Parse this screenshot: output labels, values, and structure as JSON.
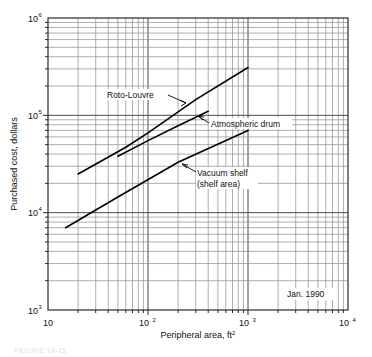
{
  "figure": {
    "caption": "FIGURE 14-11",
    "date_stamp": "Jan. 1990"
  },
  "chart_data": {
    "type": "line",
    "scale": "log-log",
    "title": "",
    "xlabel": "Peripheral area, ft",
    "xlabel_exponent": "2",
    "ylabel": "Purchased cost, dollars",
    "xlim": [
      10,
      10000
    ],
    "ylim": [
      1000,
      1000000
    ],
    "grid": "both-minor-and-major",
    "legend_position": "inline-annotations",
    "x_ticks": [
      {
        "value": 10,
        "label": "10",
        "exponent": ""
      },
      {
        "value": 100,
        "label": "10",
        "exponent": "2"
      },
      {
        "value": 1000,
        "label": "10",
        "exponent": "3"
      },
      {
        "value": 10000,
        "label": "10",
        "exponent": "4"
      }
    ],
    "y_ticks": [
      {
        "value": 1000,
        "label": "10",
        "exponent": "3"
      },
      {
        "value": 10000,
        "label": "10",
        "exponent": "4"
      },
      {
        "value": 100000,
        "label": "10",
        "exponent": "5"
      },
      {
        "value": 1000000,
        "label": "10",
        "exponent": "6"
      }
    ],
    "series": [
      {
        "name": "Roto-Louvre",
        "label": "Roto-Louvre",
        "points": [
          {
            "x": 20,
            "y": 25000
          },
          {
            "x": 60,
            "y": 47000
          },
          {
            "x": 100,
            "y": 66000
          },
          {
            "x": 300,
            "y": 145000
          },
          {
            "x": 1000,
            "y": 310000
          }
        ]
      },
      {
        "name": "Atmospheric drum",
        "label": "Atmospheric drum",
        "points": [
          {
            "x": 50,
            "y": 38000
          },
          {
            "x": 100,
            "y": 55000
          },
          {
            "x": 200,
            "y": 78000
          },
          {
            "x": 400,
            "y": 110000
          }
        ]
      },
      {
        "name": "Vacuum shelf (shelf area)",
        "label_line1": "Vacuum shelf",
        "label_line2": "(shelf area)",
        "points": [
          {
            "x": 15,
            "y": 7000
          },
          {
            "x": 50,
            "y": 14500
          },
          {
            "x": 200,
            "y": 33000
          },
          {
            "x": 1000,
            "y": 70000
          }
        ]
      }
    ],
    "annotations": [
      {
        "text": "Roto-Louvre",
        "target_series": "Roto-Louvre"
      },
      {
        "text": "Atmospheric drum",
        "target_series": "Atmospheric drum"
      },
      {
        "text": "Vacuum shelf",
        "target_series": "Vacuum shelf (shelf area)"
      },
      {
        "text": "(shelf area)",
        "target_series": "Vacuum shelf (shelf area)"
      },
      {
        "text": "Jan. 1990",
        "target_series": ""
      }
    ]
  },
  "colors": {
    "background": "#ffffff",
    "grid_major": "#4a4a4a",
    "grid_minor": "#8c8c8c",
    "frame": "#2a2a2a",
    "series": "#000000",
    "text": "#111111"
  }
}
